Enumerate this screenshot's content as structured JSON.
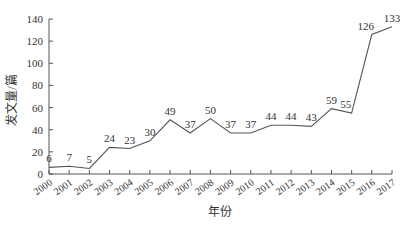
{
  "chart_data": {
    "type": "line",
    "title": "",
    "xlabel": "年份",
    "ylabel": "发文量/篇",
    "categories": [
      "2000",
      "2001",
      "2002",
      "2003",
      "2004",
      "2005",
      "2006",
      "2007",
      "2008",
      "2009",
      "2010",
      "2011",
      "2012",
      "2013",
      "2014",
      "2015",
      "2016",
      "2017"
    ],
    "series": [
      {
        "name": "发文量",
        "values": [
          6,
          7,
          5,
          24,
          23,
          30,
          49,
          37,
          50,
          37,
          37,
          44,
          44,
          43,
          59,
          55,
          126,
          133
        ]
      }
    ],
    "ylim": [
      0,
      140
    ],
    "yticks": [
      0,
      20,
      40,
      60,
      80,
      100,
      120,
      140
    ],
    "grid": false,
    "legend": "none",
    "data_labels": true,
    "line_color": "#555555"
  }
}
